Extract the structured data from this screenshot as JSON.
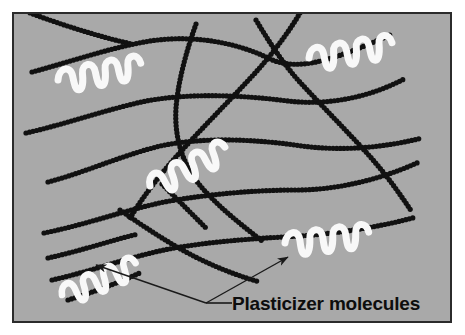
{
  "figure": {
    "type": "scientific-diagram",
    "panel": {
      "background_color": "#a9a9a9",
      "border_color": "#2b2b2b",
      "x": 13,
      "y": 13,
      "width": 438,
      "height": 309
    },
    "caption": {
      "label": "Plasticizer molecules",
      "color": "#0d0d0d",
      "x": 232,
      "y": 310
    },
    "leader": {
      "color": "#1a1a1a",
      "vertex": [
        206,
        303
      ],
      "stem_end": [
        232,
        303
      ],
      "arrows": [
        {
          "name": "arrow-to-lower-left-plasticizer",
          "to": [
            96,
            265
          ]
        },
        {
          "name": "arrow-to-lower-right-plasticizer",
          "to": [
            288,
            257
          ]
        }
      ]
    },
    "polymer_chains": {
      "name": "polymer-chain",
      "color": "#111111",
      "bead_radius": 2.6,
      "bead_spacing": 3.6,
      "count": 13,
      "paths": [
        "M 32,72 C 70,62 108,48 150,41 C 196,34 240,44 268,58 C 296,72 330,62 392,34",
        "M 30,13 C 60,24 96,36 132,44",
        "M 26,133 C 66,124 104,110 146,101 C 194,92 250,96 288,101 C 330,106 372,96 404,79",
        "M 48,182 C 86,172 120,156 160,146 C 206,136 262,140 302,146 C 348,152 390,146 422,138",
        "M 44,233 C 88,224 122,211 164,202 C 208,194 256,190 296,190 C 340,190 384,178 419,162",
        "M 52,280 C 92,271 126,258 164,250 C 208,241 264,238 300,236 C 342,233 384,226 416,217",
        "M 48,258 C 84,250 112,240 138,234",
        "M 196,24 C 186,52 178,82 176,108 C 174,140 184,168 204,190 C 224,212 246,228 262,241",
        "M 256,20 C 268,40 282,62 298,80 C 320,104 344,128 366,152 C 386,174 400,194 412,212",
        "M 300,13 C 290,30 274,52 256,72 C 232,98 206,124 184,148 C 160,174 142,198 130,218",
        "M 120,210 C 140,224 164,240 186,252 C 212,266 238,276 260,282",
        "M 68,300 C 94,292 120,282 142,272",
        "M 162,184 C 176,198 192,214 206,228"
      ]
    },
    "plasticizer_molecules": {
      "name": "plasticizer-molecule",
      "color": "#f8f8f8",
      "stroke_width": 7,
      "count": 5,
      "items": [
        {
          "name": "plasticizer-top-left",
          "x": 58,
          "y": 80,
          "rotate": -6,
          "scale": 1.0
        },
        {
          "name": "plasticizer-top-right",
          "x": 309,
          "y": 58,
          "rotate": -5,
          "scale": 1.0
        },
        {
          "name": "plasticizer-center",
          "x": 150,
          "y": 186,
          "rotate": -22,
          "scale": 1.0
        },
        {
          "name": "plasticizer-bottom-right",
          "x": 285,
          "y": 243,
          "rotate": -2,
          "scale": 1.0
        },
        {
          "name": "plasticizer-bottom-left",
          "x": 62,
          "y": 295,
          "rotate": -18,
          "scale": 0.95
        }
      ],
      "squiggle_path": "M 0,0 C 2,-12 14,-14 15,-2 C 16,9 17,12 20,12 C 24,12 25,2 25,-4 C 25,-14 37,-16 38,-4 C 39,7 40,10 43,10 C 47,10 48,0 48,-6 C 48,-16 60,-18 61,-6 C 62,5 63,8 66,8 C 70,8 71,-2 71,-8 C 71,-18 82,-19 84,-8"
    }
  }
}
